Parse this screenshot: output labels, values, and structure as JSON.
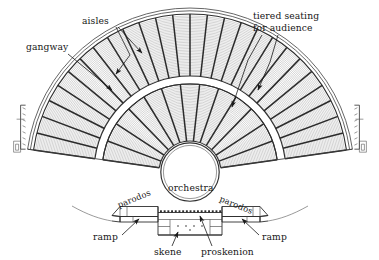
{
  "diagram": {
    "kind": "ancient-greek-theatre-plan",
    "background_color": "#ffffff",
    "ink_color": "#1b1b1b",
    "seat_hatch_color": "#8d8d8d"
  },
  "labels": {
    "aisles": "aisles",
    "tiered_seating": "tiered seating\nfor audience",
    "tiered_seating_line1": "tiered seating",
    "tiered_seating_line2": "for audience",
    "gangway": "gangway",
    "orchestra": "orchestra",
    "parodos_left": "parodos",
    "parodos_right": "parodos",
    "ramp_left": "ramp",
    "ramp_right": "ramp",
    "skene": "skene",
    "proskenion": "proskenion"
  },
  "geometry": {
    "center_x": 190,
    "center_y": 172,
    "orchestra_radius": 28,
    "lower_tier_inner_radius": 31,
    "lower_tier_outer_radius": 88,
    "gangway_inner_radius": 88,
    "gangway_outer_radius": 96,
    "upper_tier_inner_radius": 96,
    "upper_tier_outer_radius": 158,
    "lower_tier_wedges": 13,
    "upper_tier_wedges": 26,
    "cavea_start_angle_deg": 188,
    "cavea_end_angle_deg": 352
  }
}
